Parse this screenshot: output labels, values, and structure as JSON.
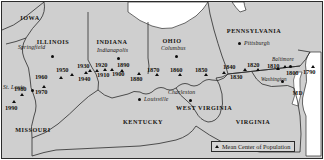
{
  "map": {
    "title": "Mean Center of Population of the United States",
    "legend": {
      "symbol": "triangle-marker",
      "label": "Mean Center of Population"
    },
    "colors": {
      "land": "#cfcfcf",
      "water": "#ffffff",
      "border": "#2b2b2b",
      "marker": "#0d0d0d",
      "legend_background": "#d5d5d5"
    },
    "states": [
      {
        "name": "IOWA",
        "x": 30,
        "y": 14
      },
      {
        "name": "ILLINOIS",
        "x": 53,
        "y": 38
      },
      {
        "name": "INDIANA",
        "x": 112,
        "y": 38
      },
      {
        "name": "OHIO",
        "x": 172,
        "y": 37
      },
      {
        "name": "PENNSYLVANIA",
        "x": 254,
        "y": 27
      },
      {
        "name": "MISSOURI",
        "x": 32,
        "y": 126
      },
      {
        "name": "KENTUCKY",
        "x": 142,
        "y": 118
      },
      {
        "name": "WEST VIRGINIA",
        "x": 194,
        "y": 108
      },
      {
        "name": "VIRGINIA",
        "x": 252,
        "y": 118
      },
      {
        "name": "MD",
        "x": 297,
        "y": 90
      }
    ],
    "cities": [
      {
        "name": "Springfield",
        "lx": 18,
        "ly": 44,
        "dx": 51,
        "dy": 55
      },
      {
        "name": "Indianapolis",
        "lx": 97,
        "ly": 47,
        "dx": 117,
        "dy": 57
      },
      {
        "name": "Columbus",
        "lx": 161,
        "ly": 45,
        "dx": 175,
        "dy": 55
      },
      {
        "name": "Pittsburgh",
        "lx": 244,
        "ly": 41,
        "dx": 238,
        "dy": 43
      },
      {
        "name": "St. Louis",
        "lx": 3,
        "ly": 84,
        "dx": 31,
        "dy": 89
      },
      {
        "name": "Louisville",
        "lx": 144,
        "ly": 97,
        "dx": 138,
        "dy": 99
      },
      {
        "name": "Charleston",
        "lx": 168,
        "ly": 90,
        "dx": 189,
        "dy": 100
      },
      {
        "name": "Washington",
        "lx": 263,
        "ly": 77,
        "dx": 281,
        "dy": 80
      },
      {
        "name": "Baltimore",
        "lx": 273,
        "ly": 57,
        "dx": 289,
        "dy": 66
      }
    ],
    "centers": [
      {
        "year": "1790",
        "lx": 303,
        "ly": 68,
        "mx": 311,
        "my": 65
      },
      {
        "year": "1800",
        "lx": 286,
        "ly": 69,
        "mx": 283,
        "my": 65
      },
      {
        "year": "1810",
        "lx": 268,
        "ly": 63,
        "mx": 276,
        "my": 67
      },
      {
        "year": "1820",
        "lx": 249,
        "ly": 62,
        "mx": 256,
        "my": 68
      },
      {
        "year": "1830",
        "lx": 231,
        "ly": 73,
        "mx": 243,
        "my": 68
      },
      {
        "year": "1840",
        "lx": 224,
        "ly": 64,
        "mx": 222,
        "my": 71
      },
      {
        "year": "1850",
        "lx": 196,
        "ly": 66,
        "mx": 204,
        "my": 73
      },
      {
        "year": "1860",
        "lx": 172,
        "ly": 66,
        "mx": 178,
        "my": 73
      },
      {
        "year": "1870",
        "lx": 149,
        "ly": 66,
        "mx": 155,
        "my": 73
      },
      {
        "year": "1880",
        "lx": 131,
        "ly": 75,
        "mx": 137,
        "my": 72
      },
      {
        "year": "1890",
        "lx": 120,
        "ly": 61,
        "mx": 120,
        "my": 69
      },
      {
        "year": "1900",
        "lx": 113,
        "ly": 70,
        "mx": 110,
        "my": 68
      },
      {
        "year": "1910",
        "lx": 99,
        "ly": 71,
        "mx": 103,
        "my": 68
      },
      {
        "year": "1920",
        "lx": 97,
        "ly": 62,
        "mx": 95,
        "my": 69
      },
      {
        "year": "1930",
        "lx": 78,
        "ly": 63,
        "mx": 88,
        "my": 69
      },
      {
        "year": "1940",
        "lx": 79,
        "ly": 76,
        "mx": 84,
        "my": 72
      },
      {
        "year": "1950",
        "lx": 57,
        "ly": 67,
        "mx": 70,
        "my": 73
      },
      {
        "year": "1960",
        "lx": 36,
        "ly": 73,
        "mx": 59,
        "my": 76
      },
      {
        "year": "1970",
        "lx": 36,
        "ly": 88,
        "mx": 42,
        "my": 85
      },
      {
        "year": "1980",
        "lx": 15,
        "ly": 86,
        "mx": 20,
        "my": 93
      },
      {
        "year": "1990",
        "lx": 6,
        "ly": 105,
        "mx": 12,
        "my": 101
      }
    ]
  }
}
